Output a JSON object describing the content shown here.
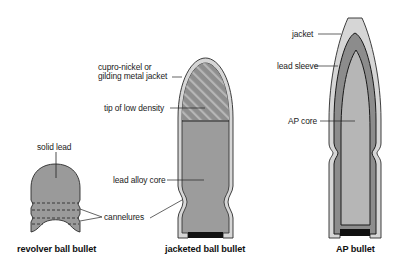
{
  "diagram": {
    "bullets": [
      {
        "id": "revolver",
        "caption": "revolver ball bullet",
        "labels": {
          "solid_lead": "solid lead",
          "cannelures": "cannelures"
        }
      },
      {
        "id": "jacketed",
        "caption": "jacketed ball bullet",
        "labels": {
          "jacket_line1": "cupro-nickel or",
          "jacket_line2": "gilding metal jacket",
          "tip": "tip of low density",
          "core": "lead alloy core",
          "cannelures": "cannelures"
        }
      },
      {
        "id": "ap",
        "caption": "AP bullet",
        "labels": {
          "jacket": "jacket",
          "lead_sleeve": "lead sleeve",
          "ap_core": "AP core"
        }
      }
    ],
    "colors": {
      "jacket": "#d4d4d4",
      "lead": "#9a9a9a",
      "lead_dark": "#8a8a8a",
      "ap_core": "#b4b4b4",
      "base": "#111111",
      "outline": "#222222"
    }
  }
}
